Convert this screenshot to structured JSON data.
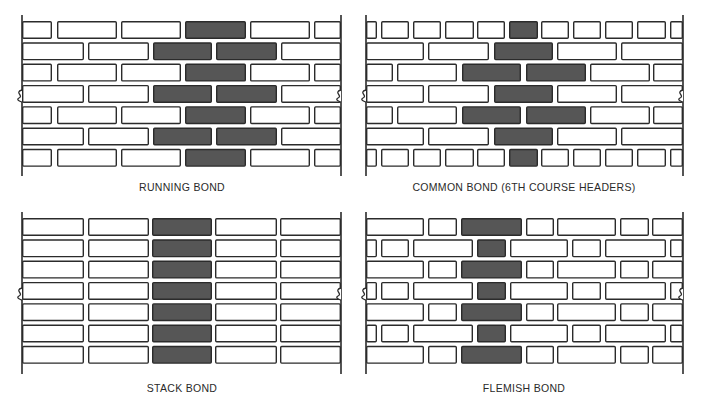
{
  "colors": {
    "mortar_line": "#2b2b2b",
    "brick_fill": "#ffffff",
    "highlight_fill": "#565656",
    "background": "#ffffff"
  },
  "panels": [
    {
      "id": "running-bond",
      "label": "RUNNING BOND",
      "label_x": 182,
      "label_y": 181,
      "x_left": 22,
      "x_right": 341,
      "y_top": 21,
      "course_pitch": 21.3,
      "brick_height": 18,
      "line_top": 15,
      "line_bottom": 176,
      "break_y": 96,
      "courses": [
        [
          [
            22,
            52,
            0
          ],
          [
            57,
            117,
            0
          ],
          [
            121,
            181,
            0
          ],
          [
            185,
            246,
            1
          ],
          [
            250,
            310,
            0
          ],
          [
            314,
            341,
            0
          ]
        ],
        [
          [
            22,
            84,
            0
          ],
          [
            88,
            149,
            0
          ],
          [
            153,
            212,
            1
          ],
          [
            216,
            277,
            1
          ],
          [
            281,
            341,
            0
          ]
        ],
        [
          [
            22,
            52,
            0
          ],
          [
            57,
            117,
            0
          ],
          [
            121,
            181,
            0
          ],
          [
            185,
            246,
            1
          ],
          [
            250,
            310,
            0
          ],
          [
            314,
            341,
            0
          ]
        ],
        [
          [
            22,
            84,
            0
          ],
          [
            88,
            149,
            0
          ],
          [
            153,
            212,
            1
          ],
          [
            216,
            277,
            1
          ],
          [
            281,
            341,
            0
          ]
        ],
        [
          [
            22,
            52,
            0
          ],
          [
            57,
            117,
            0
          ],
          [
            121,
            181,
            0
          ],
          [
            185,
            246,
            1
          ],
          [
            250,
            310,
            0
          ],
          [
            314,
            341,
            0
          ]
        ],
        [
          [
            22,
            84,
            0
          ],
          [
            88,
            149,
            0
          ],
          [
            153,
            212,
            1
          ],
          [
            216,
            277,
            1
          ],
          [
            281,
            341,
            0
          ]
        ],
        [
          [
            22,
            52,
            0
          ],
          [
            57,
            117,
            0
          ],
          [
            121,
            181,
            0
          ],
          [
            185,
            246,
            1
          ],
          [
            250,
            310,
            0
          ],
          [
            314,
            341,
            0
          ]
        ]
      ]
    },
    {
      "id": "common-bond",
      "label": "COMMON BOND (6TH COURSE HEADERS)",
      "label_x": 524,
      "label_y": 181,
      "x_left": 366,
      "x_right": 683,
      "y_top": 21,
      "course_pitch": 21.3,
      "brick_height": 18,
      "line_top": 15,
      "line_bottom": 176,
      "break_y": 96,
      "courses": [
        [
          [
            366,
            377,
            0
          ],
          [
            381,
            409,
            0
          ],
          [
            413,
            441,
            0
          ],
          [
            445,
            474,
            0
          ],
          [
            477,
            505,
            0
          ],
          [
            509,
            538,
            1
          ],
          [
            541,
            569,
            0
          ],
          [
            573,
            601,
            0
          ],
          [
            605,
            633,
            0
          ],
          [
            637,
            666,
            0
          ],
          [
            670,
            683,
            0
          ]
        ],
        [
          [
            366,
            424,
            0
          ],
          [
            428,
            489,
            0
          ],
          [
            494,
            553,
            1
          ],
          [
            557,
            617,
            0
          ],
          [
            621,
            683,
            0
          ]
        ],
        [
          [
            366,
            393,
            0
          ],
          [
            397,
            457,
            0
          ],
          [
            462,
            521,
            1
          ],
          [
            526,
            586,
            1
          ],
          [
            590,
            650,
            0
          ],
          [
            653,
            683,
            0
          ]
        ],
        [
          [
            366,
            424,
            0
          ],
          [
            428,
            489,
            0
          ],
          [
            494,
            553,
            1
          ],
          [
            557,
            617,
            0
          ],
          [
            621,
            683,
            0
          ]
        ],
        [
          [
            366,
            393,
            0
          ],
          [
            397,
            457,
            0
          ],
          [
            462,
            521,
            1
          ],
          [
            526,
            586,
            1
          ],
          [
            590,
            650,
            0
          ],
          [
            653,
            683,
            0
          ]
        ],
        [
          [
            366,
            424,
            0
          ],
          [
            428,
            489,
            0
          ],
          [
            494,
            553,
            1
          ],
          [
            557,
            617,
            0
          ],
          [
            621,
            683,
            0
          ]
        ],
        [
          [
            366,
            377,
            0
          ],
          [
            381,
            409,
            0
          ],
          [
            413,
            441,
            0
          ],
          [
            445,
            474,
            0
          ],
          [
            477,
            505,
            0
          ],
          [
            509,
            538,
            1
          ],
          [
            541,
            569,
            0
          ],
          [
            573,
            601,
            0
          ],
          [
            605,
            633,
            0
          ],
          [
            637,
            666,
            0
          ],
          [
            670,
            683,
            0
          ]
        ]
      ]
    },
    {
      "id": "stack-bond",
      "label": "STACK BOND",
      "label_x": 182,
      "label_y": 382,
      "x_left": 22,
      "x_right": 341,
      "y_top": 218,
      "course_pitch": 21.3,
      "brick_height": 18,
      "line_top": 212,
      "line_bottom": 374,
      "break_y": 294,
      "courses": [
        [
          [
            22,
            84,
            0
          ],
          [
            88,
            149,
            0
          ],
          [
            152,
            212,
            1
          ],
          [
            215,
            277,
            0
          ],
          [
            280,
            341,
            0
          ]
        ],
        [
          [
            22,
            84,
            0
          ],
          [
            88,
            149,
            0
          ],
          [
            152,
            212,
            1
          ],
          [
            215,
            277,
            0
          ],
          [
            280,
            341,
            0
          ]
        ],
        [
          [
            22,
            84,
            0
          ],
          [
            88,
            149,
            0
          ],
          [
            152,
            212,
            1
          ],
          [
            215,
            277,
            0
          ],
          [
            280,
            341,
            0
          ]
        ],
        [
          [
            22,
            84,
            0
          ],
          [
            88,
            149,
            0
          ],
          [
            152,
            212,
            1
          ],
          [
            215,
            277,
            0
          ],
          [
            280,
            341,
            0
          ]
        ],
        [
          [
            22,
            84,
            0
          ],
          [
            88,
            149,
            0
          ],
          [
            152,
            212,
            1
          ],
          [
            215,
            277,
            0
          ],
          [
            280,
            341,
            0
          ]
        ],
        [
          [
            22,
            84,
            0
          ],
          [
            88,
            149,
            0
          ],
          [
            152,
            212,
            1
          ],
          [
            215,
            277,
            0
          ],
          [
            280,
            341,
            0
          ]
        ],
        [
          [
            22,
            84,
            0
          ],
          [
            88,
            149,
            0
          ],
          [
            152,
            212,
            1
          ],
          [
            215,
            277,
            0
          ],
          [
            280,
            341,
            0
          ]
        ]
      ]
    },
    {
      "id": "flemish-bond",
      "label": "FLEMISH BOND",
      "label_x": 524,
      "label_y": 382,
      "x_left": 366,
      "x_right": 683,
      "y_top": 218,
      "course_pitch": 21.3,
      "brick_height": 18,
      "line_top": 212,
      "line_bottom": 374,
      "break_y": 294,
      "courses": [
        [
          [
            366,
            424,
            0
          ],
          [
            428,
            457,
            0
          ],
          [
            461,
            522,
            1
          ],
          [
            526,
            554,
            0
          ],
          [
            557,
            616,
            0
          ],
          [
            620,
            649,
            0
          ],
          [
            652,
            683,
            0
          ]
        ],
        [
          [
            366,
            377,
            0
          ],
          [
            381,
            409,
            0
          ],
          [
            413,
            473,
            0
          ],
          [
            477,
            506,
            1
          ],
          [
            510,
            568,
            0
          ],
          [
            572,
            601,
            0
          ],
          [
            605,
            666,
            0
          ],
          [
            670,
            683,
            0
          ]
        ],
        [
          [
            366,
            424,
            0
          ],
          [
            428,
            457,
            0
          ],
          [
            461,
            522,
            1
          ],
          [
            526,
            554,
            0
          ],
          [
            557,
            616,
            0
          ],
          [
            620,
            649,
            0
          ],
          [
            652,
            683,
            0
          ]
        ],
        [
          [
            366,
            377,
            0
          ],
          [
            381,
            409,
            0
          ],
          [
            413,
            473,
            0
          ],
          [
            477,
            506,
            1
          ],
          [
            510,
            568,
            0
          ],
          [
            572,
            601,
            0
          ],
          [
            605,
            666,
            0
          ],
          [
            670,
            683,
            0
          ]
        ],
        [
          [
            366,
            424,
            0
          ],
          [
            428,
            457,
            0
          ],
          [
            461,
            522,
            1
          ],
          [
            526,
            554,
            0
          ],
          [
            557,
            616,
            0
          ],
          [
            620,
            649,
            0
          ],
          [
            652,
            683,
            0
          ]
        ],
        [
          [
            366,
            377,
            0
          ],
          [
            381,
            409,
            0
          ],
          [
            413,
            473,
            0
          ],
          [
            477,
            506,
            1
          ],
          [
            510,
            568,
            0
          ],
          [
            572,
            601,
            0
          ],
          [
            605,
            666,
            0
          ],
          [
            670,
            683,
            0
          ]
        ],
        [
          [
            366,
            424,
            0
          ],
          [
            428,
            457,
            0
          ],
          [
            461,
            522,
            1
          ],
          [
            526,
            554,
            0
          ],
          [
            557,
            616,
            0
          ],
          [
            620,
            649,
            0
          ],
          [
            652,
            683,
            0
          ]
        ]
      ]
    }
  ]
}
